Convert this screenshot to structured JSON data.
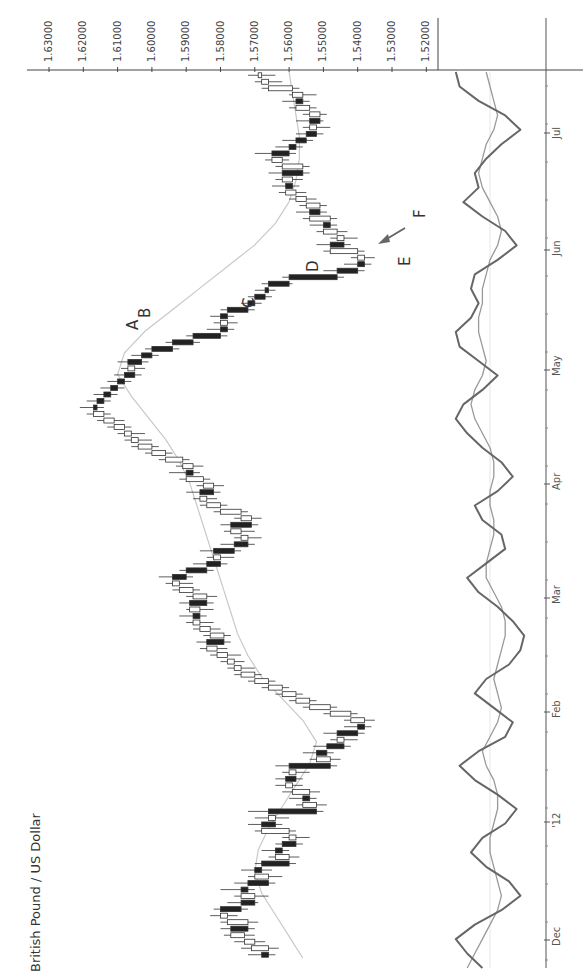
{
  "chart_data": {
    "type": "candlestick",
    "title": "British Pound / US Dollar",
    "orientation": "rotated-90-clockwise",
    "price_axis": {
      "label": "",
      "ticks": [
        "1.63000",
        "1.62000",
        "1.61000",
        "1.60000",
        "1.59000",
        "1.58000",
        "1.57000",
        "1.56000",
        "1.55000",
        "1.54000",
        "1.53000",
        "1.52000"
      ],
      "range": [
        1.5175,
        1.6345
      ]
    },
    "date_axis": {
      "ticks": [
        "Dec",
        "'12",
        "Feb",
        "Mar",
        "Apr",
        "May",
        "Jun",
        "Jul"
      ],
      "tick_positions": [
        0.0,
        0.145,
        0.295,
        0.445,
        0.595,
        0.745,
        0.905,
        1.06
      ]
    },
    "annotations": [
      "A",
      "B",
      "C",
      "D",
      "E",
      "F"
    ],
    "candles": [
      {
        "o": 1.568,
        "h": 1.572,
        "l": 1.564,
        "c": 1.566
      },
      {
        "o": 1.566,
        "h": 1.574,
        "l": 1.563,
        "c": 1.571
      },
      {
        "o": 1.57,
        "h": 1.576,
        "l": 1.567,
        "c": 1.573
      },
      {
        "o": 1.573,
        "h": 1.579,
        "l": 1.57,
        "c": 1.577
      },
      {
        "o": 1.577,
        "h": 1.58,
        "l": 1.57,
        "c": 1.572
      },
      {
        "o": 1.572,
        "h": 1.58,
        "l": 1.569,
        "c": 1.578
      },
      {
        "o": 1.578,
        "h": 1.583,
        "l": 1.575,
        "c": 1.58
      },
      {
        "o": 1.58,
        "h": 1.582,
        "l": 1.572,
        "c": 1.574
      },
      {
        "o": 1.574,
        "h": 1.578,
        "l": 1.569,
        "c": 1.57
      },
      {
        "o": 1.57,
        "h": 1.576,
        "l": 1.566,
        "c": 1.574
      },
      {
        "o": 1.574,
        "h": 1.58,
        "l": 1.57,
        "c": 1.572
      },
      {
        "o": 1.572,
        "h": 1.576,
        "l": 1.564,
        "c": 1.566
      },
      {
        "o": 1.566,
        "h": 1.572,
        "l": 1.562,
        "c": 1.57
      },
      {
        "o": 1.57,
        "h": 1.574,
        "l": 1.565,
        "c": 1.568
      },
      {
        "o": 1.568,
        "h": 1.57,
        "l": 1.558,
        "c": 1.56
      },
      {
        "o": 1.56,
        "h": 1.566,
        "l": 1.557,
        "c": 1.564
      },
      {
        "o": 1.564,
        "h": 1.568,
        "l": 1.56,
        "c": 1.562
      },
      {
        "o": 1.562,
        "h": 1.564,
        "l": 1.556,
        "c": 1.558
      },
      {
        "o": 1.558,
        "h": 1.562,
        "l": 1.554,
        "c": 1.56
      },
      {
        "o": 1.56,
        "h": 1.57,
        "l": 1.558,
        "c": 1.568
      },
      {
        "o": 1.568,
        "h": 1.572,
        "l": 1.562,
        "c": 1.564
      },
      {
        "o": 1.564,
        "h": 1.57,
        "l": 1.56,
        "c": 1.566
      },
      {
        "o": 1.566,
        "h": 1.572,
        "l": 1.55,
        "c": 1.552
      },
      {
        "o": 1.552,
        "h": 1.558,
        "l": 1.549,
        "c": 1.556
      },
      {
        "o": 1.556,
        "h": 1.56,
        "l": 1.552,
        "c": 1.554
      },
      {
        "o": 1.554,
        "h": 1.562,
        "l": 1.551,
        "c": 1.559
      },
      {
        "o": 1.559,
        "h": 1.564,
        "l": 1.556,
        "c": 1.561
      },
      {
        "o": 1.561,
        "h": 1.564,
        "l": 1.556,
        "c": 1.558
      },
      {
        "o": 1.558,
        "h": 1.562,
        "l": 1.554,
        "c": 1.56
      },
      {
        "o": 1.56,
        "h": 1.564,
        "l": 1.546,
        "c": 1.548
      },
      {
        "o": 1.548,
        "h": 1.554,
        "l": 1.545,
        "c": 1.552
      },
      {
        "o": 1.552,
        "h": 1.556,
        "l": 1.547,
        "c": 1.549
      },
      {
        "o": 1.549,
        "h": 1.553,
        "l": 1.542,
        "c": 1.544
      },
      {
        "o": 1.544,
        "h": 1.548,
        "l": 1.54,
        "c": 1.546
      },
      {
        "o": 1.546,
        "h": 1.55,
        "l": 1.538,
        "c": 1.54
      },
      {
        "o": 1.54,
        "h": 1.544,
        "l": 1.536,
        "c": 1.538
      },
      {
        "o": 1.538,
        "h": 1.544,
        "l": 1.535,
        "c": 1.542
      },
      {
        "o": 1.542,
        "h": 1.55,
        "l": 1.54,
        "c": 1.548
      },
      {
        "o": 1.548,
        "h": 1.556,
        "l": 1.546,
        "c": 1.554
      },
      {
        "o": 1.554,
        "h": 1.56,
        "l": 1.552,
        "c": 1.558
      },
      {
        "o": 1.558,
        "h": 1.564,
        "l": 1.556,
        "c": 1.562
      },
      {
        "o": 1.562,
        "h": 1.568,
        "l": 1.56,
        "c": 1.566
      },
      {
        "o": 1.566,
        "h": 1.572,
        "l": 1.564,
        "c": 1.57
      },
      {
        "o": 1.57,
        "h": 1.576,
        "l": 1.568,
        "c": 1.574
      },
      {
        "o": 1.574,
        "h": 1.578,
        "l": 1.57,
        "c": 1.576
      },
      {
        "o": 1.576,
        "h": 1.58,
        "l": 1.573,
        "c": 1.578
      },
      {
        "o": 1.578,
        "h": 1.583,
        "l": 1.574,
        "c": 1.581
      },
      {
        "o": 1.581,
        "h": 1.586,
        "l": 1.578,
        "c": 1.584
      },
      {
        "o": 1.584,
        "h": 1.587,
        "l": 1.577,
        "c": 1.579
      },
      {
        "o": 1.579,
        "h": 1.585,
        "l": 1.577,
        "c": 1.583
      },
      {
        "o": 1.583,
        "h": 1.588,
        "l": 1.58,
        "c": 1.586
      },
      {
        "o": 1.586,
        "h": 1.59,
        "l": 1.582,
        "c": 1.588
      },
      {
        "o": 1.588,
        "h": 1.592,
        "l": 1.584,
        "c": 1.586
      },
      {
        "o": 1.586,
        "h": 1.59,
        "l": 1.582,
        "c": 1.589
      },
      {
        "o": 1.589,
        "h": 1.592,
        "l": 1.582,
        "c": 1.584
      },
      {
        "o": 1.584,
        "h": 1.59,
        "l": 1.581,
        "c": 1.588
      },
      {
        "o": 1.588,
        "h": 1.594,
        "l": 1.586,
        "c": 1.592
      },
      {
        "o": 1.592,
        "h": 1.596,
        "l": 1.588,
        "c": 1.594
      },
      {
        "o": 1.594,
        "h": 1.598,
        "l": 1.588,
        "c": 1.59
      },
      {
        "o": 1.59,
        "h": 1.592,
        "l": 1.582,
        "c": 1.584
      },
      {
        "o": 1.584,
        "h": 1.588,
        "l": 1.578,
        "c": 1.58
      },
      {
        "o": 1.58,
        "h": 1.584,
        "l": 1.576,
        "c": 1.582
      },
      {
        "o": 1.582,
        "h": 1.586,
        "l": 1.574,
        "c": 1.576
      },
      {
        "o": 1.576,
        "h": 1.58,
        "l": 1.57,
        "c": 1.572
      },
      {
        "o": 1.572,
        "h": 1.576,
        "l": 1.568,
        "c": 1.574
      },
      {
        "o": 1.574,
        "h": 1.579,
        "l": 1.57,
        "c": 1.577
      },
      {
        "o": 1.577,
        "h": 1.58,
        "l": 1.569,
        "c": 1.571
      },
      {
        "o": 1.571,
        "h": 1.576,
        "l": 1.568,
        "c": 1.574
      },
      {
        "o": 1.574,
        "h": 1.582,
        "l": 1.572,
        "c": 1.58
      },
      {
        "o": 1.58,
        "h": 1.586,
        "l": 1.578,
        "c": 1.584
      },
      {
        "o": 1.584,
        "h": 1.588,
        "l": 1.581,
        "c": 1.586
      },
      {
        "o": 1.586,
        "h": 1.59,
        "l": 1.58,
        "c": 1.582
      },
      {
        "o": 1.582,
        "h": 1.587,
        "l": 1.579,
        "c": 1.585
      },
      {
        "o": 1.585,
        "h": 1.592,
        "l": 1.583,
        "c": 1.59
      },
      {
        "o": 1.59,
        "h": 1.595,
        "l": 1.586,
        "c": 1.588
      },
      {
        "o": 1.588,
        "h": 1.593,
        "l": 1.585,
        "c": 1.591
      },
      {
        "o": 1.591,
        "h": 1.598,
        "l": 1.589,
        "c": 1.596
      },
      {
        "o": 1.596,
        "h": 1.602,
        "l": 1.594,
        "c": 1.6
      },
      {
        "o": 1.6,
        "h": 1.606,
        "l": 1.598,
        "c": 1.604
      },
      {
        "o": 1.604,
        "h": 1.608,
        "l": 1.6,
        "c": 1.606
      },
      {
        "o": 1.606,
        "h": 1.61,
        "l": 1.602,
        "c": 1.608
      },
      {
        "o": 1.608,
        "h": 1.613,
        "l": 1.606,
        "c": 1.611
      },
      {
        "o": 1.611,
        "h": 1.616,
        "l": 1.608,
        "c": 1.614
      },
      {
        "o": 1.614,
        "h": 1.619,
        "l": 1.612,
        "c": 1.617
      },
      {
        "o": 1.617,
        "h": 1.621,
        "l": 1.614,
        "c": 1.616
      },
      {
        "o": 1.616,
        "h": 1.619,
        "l": 1.612,
        "c": 1.614
      },
      {
        "o": 1.614,
        "h": 1.617,
        "l": 1.61,
        "c": 1.612
      },
      {
        "o": 1.612,
        "h": 1.615,
        "l": 1.608,
        "c": 1.61
      },
      {
        "o": 1.61,
        "h": 1.613,
        "l": 1.606,
        "c": 1.608
      },
      {
        "o": 1.608,
        "h": 1.611,
        "l": 1.603,
        "c": 1.605
      },
      {
        "o": 1.605,
        "h": 1.609,
        "l": 1.602,
        "c": 1.607
      },
      {
        "o": 1.607,
        "h": 1.61,
        "l": 1.601,
        "c": 1.603
      },
      {
        "o": 1.603,
        "h": 1.606,
        "l": 1.598,
        "c": 1.6
      },
      {
        "o": 1.6,
        "h": 1.602,
        "l": 1.592,
        "c": 1.594
      },
      {
        "o": 1.594,
        "h": 1.596,
        "l": 1.586,
        "c": 1.588
      },
      {
        "o": 1.588,
        "h": 1.59,
        "l": 1.578,
        "c": 1.58
      },
      {
        "o": 1.58,
        "h": 1.584,
        "l": 1.576,
        "c": 1.578
      },
      {
        "o": 1.578,
        "h": 1.582,
        "l": 1.575,
        "c": 1.58
      },
      {
        "o": 1.58,
        "h": 1.583,
        "l": 1.576,
        "c": 1.578
      },
      {
        "o": 1.578,
        "h": 1.58,
        "l": 1.57,
        "c": 1.572
      },
      {
        "o": 1.572,
        "h": 1.574,
        "l": 1.568,
        "c": 1.57
      },
      {
        "o": 1.57,
        "h": 1.572,
        "l": 1.565,
        "c": 1.567
      },
      {
        "o": 1.567,
        "h": 1.57,
        "l": 1.564,
        "c": 1.566
      },
      {
        "o": 1.566,
        "h": 1.568,
        "l": 1.559,
        "c": 1.56
      },
      {
        "o": 1.56,
        "h": 1.562,
        "l": 1.544,
        "c": 1.546
      },
      {
        "o": 1.546,
        "h": 1.55,
        "l": 1.538,
        "c": 1.54
      },
      {
        "o": 1.54,
        "h": 1.544,
        "l": 1.536,
        "c": 1.538
      },
      {
        "o": 1.538,
        "h": 1.542,
        "l": 1.535,
        "c": 1.54
      },
      {
        "o": 1.54,
        "h": 1.55,
        "l": 1.538,
        "c": 1.548
      },
      {
        "o": 1.548,
        "h": 1.552,
        "l": 1.542,
        "c": 1.544
      },
      {
        "o": 1.544,
        "h": 1.548,
        "l": 1.54,
        "c": 1.546
      },
      {
        "o": 1.546,
        "h": 1.552,
        "l": 1.543,
        "c": 1.55
      },
      {
        "o": 1.55,
        "h": 1.554,
        "l": 1.546,
        "c": 1.548
      },
      {
        "o": 1.548,
        "h": 1.556,
        "l": 1.546,
        "c": 1.554
      },
      {
        "o": 1.554,
        "h": 1.558,
        "l": 1.549,
        "c": 1.551
      },
      {
        "o": 1.551,
        "h": 1.557,
        "l": 1.549,
        "c": 1.555
      },
      {
        "o": 1.555,
        "h": 1.56,
        "l": 1.552,
        "c": 1.558
      },
      {
        "o": 1.558,
        "h": 1.563,
        "l": 1.555,
        "c": 1.561
      },
      {
        "o": 1.561,
        "h": 1.565,
        "l": 1.557,
        "c": 1.559
      },
      {
        "o": 1.559,
        "h": 1.564,
        "l": 1.556,
        "c": 1.562
      },
      {
        "o": 1.562,
        "h": 1.566,
        "l": 1.554,
        "c": 1.556
      },
      {
        "o": 1.556,
        "h": 1.564,
        "l": 1.554,
        "c": 1.562
      },
      {
        "o": 1.562,
        "h": 1.567,
        "l": 1.56,
        "c": 1.565
      },
      {
        "o": 1.565,
        "h": 1.57,
        "l": 1.558,
        "c": 1.56
      },
      {
        "o": 1.56,
        "h": 1.564,
        "l": 1.556,
        "c": 1.558
      },
      {
        "o": 1.558,
        "h": 1.562,
        "l": 1.553,
        "c": 1.555
      },
      {
        "o": 1.555,
        "h": 1.558,
        "l": 1.55,
        "c": 1.552
      },
      {
        "o": 1.552,
        "h": 1.556,
        "l": 1.548,
        "c": 1.554
      },
      {
        "o": 1.554,
        "h": 1.558,
        "l": 1.55,
        "c": 1.551
      },
      {
        "o": 1.551,
        "h": 1.556,
        "l": 1.549,
        "c": 1.554
      },
      {
        "o": 1.554,
        "h": 1.56,
        "l": 1.552,
        "c": 1.558
      },
      {
        "o": 1.558,
        "h": 1.562,
        "l": 1.554,
        "c": 1.556
      },
      {
        "o": 1.556,
        "h": 1.56,
        "l": 1.552,
        "c": 1.559
      },
      {
        "o": 1.559,
        "h": 1.568,
        "l": 1.557,
        "c": 1.566
      },
      {
        "o": 1.566,
        "h": 1.57,
        "l": 1.562,
        "c": 1.568
      },
      {
        "o": 1.568,
        "h": 1.572,
        "l": 1.564,
        "c": 1.569
      }
    ],
    "ma_series": {
      "name": "Moving average",
      "color": "#c8c8c8",
      "values": [
        1.556,
        1.56,
        1.564,
        1.568,
        1.57,
        1.569,
        1.566,
        1.562,
        1.558,
        1.554,
        1.552,
        1.556,
        1.562,
        1.568,
        1.572,
        1.575,
        1.577,
        1.579,
        1.581,
        1.583,
        1.585,
        1.587,
        1.589,
        1.592,
        1.596,
        1.601,
        1.606,
        1.61,
        1.608,
        1.602,
        1.594,
        1.586,
        1.578,
        1.57,
        1.564,
        1.56,
        1.558,
        1.557,
        1.557,
        1.558,
        1.559,
        1.56
      ]
    },
    "indicator": {
      "fast": {
        "name": "Fast oscillator",
        "color": "#666666",
        "values": [
          0.2,
          0.6,
          0.9,
          0.4,
          -0.3,
          -0.8,
          -0.5,
          0.1,
          0.5,
          0.2,
          -0.4,
          -0.7,
          -0.2,
          0.4,
          0.8,
          0.3,
          -0.4,
          -0.6,
          -0.1,
          0.4,
          0.1,
          -0.5,
          -0.8,
          -0.9,
          -0.6,
          -0.2,
          0.3,
          0.6,
          0.1,
          -0.4,
          -0.3,
          0.2,
          0.4,
          -0.2,
          -0.6,
          -0.3,
          0.2,
          0.6,
          0.9,
          0.7,
          0.2,
          -0.2,
          0.3,
          0.8,
          0.9,
          0.5,
          0.3,
          0.5,
          0.4,
          -0.2,
          -0.7,
          -0.4,
          0.2,
          0.7,
          0.3,
          0.4,
          0.1,
          -0.3,
          -0.8,
          -0.4,
          0.3,
          0.8,
          0.9
        ]
      },
      "slow": {
        "name": "Slow oscillator",
        "color": "#999999",
        "values": [
          0.6,
          0.4,
          0.2,
          0.0,
          -0.2,
          -0.3,
          -0.2,
          -0.1,
          0.0,
          0.0,
          -0.1,
          -0.2,
          -0.2,
          -0.1,
          0.1,
          0.2,
          0.0,
          -0.2,
          -0.3,
          -0.2,
          -0.1,
          -0.2,
          -0.3,
          -0.4,
          -0.4,
          -0.3,
          -0.1,
          0.1,
          0.1,
          0.0,
          -0.1,
          -0.1,
          0.0,
          0.0,
          -0.1,
          -0.1,
          0.0,
          0.2,
          0.4,
          0.5,
          0.4,
          0.2,
          0.1,
          0.2,
          0.3,
          0.3,
          0.2,
          0.2,
          0.1,
          0.0,
          -0.2,
          -0.3,
          -0.2,
          0.0,
          0.2,
          0.3,
          0.2,
          0.1,
          -0.1,
          -0.2,
          -0.1,
          0.0,
          0.1
        ]
      },
      "baseline": 0
    }
  }
}
